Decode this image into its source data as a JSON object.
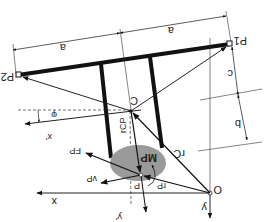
{
  "diagram": {
    "title": "",
    "orientation": "rotated 180 degrees",
    "colors": {
      "line": "#111111",
      "thin_line": "#333333",
      "ellipse_fill": "#9a9a9a",
      "background": "#ffffff"
    },
    "points": {
      "P1": "P1",
      "P2": "P2",
      "C": "C",
      "P": "P",
      "O": "O"
    },
    "vectors": {
      "rC": "rC",
      "rCP": "rCP",
      "rP": "rP",
      "FP": "FP",
      "vP": "vP",
      "MP": "MP"
    },
    "axes": {
      "x": "x",
      "y": "y",
      "x_prime": "x'",
      "y_prime": "y'"
    },
    "angle": "φ",
    "dimensions": {
      "a_left": "a",
      "a_right": "a",
      "b": "b",
      "c": "c"
    }
  }
}
